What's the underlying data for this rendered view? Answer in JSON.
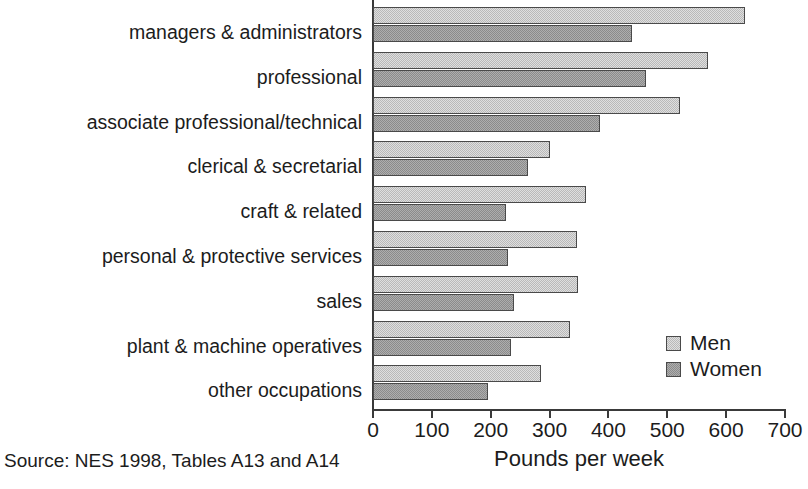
{
  "chart_data": {
    "type": "bar",
    "orientation": "horizontal",
    "title": "",
    "xlabel": "Pounds per week",
    "ylabel": "",
    "xlim": [
      0,
      700
    ],
    "xticks": [
      0,
      100,
      200,
      300,
      400,
      500,
      600,
      700
    ],
    "grid": false,
    "legend_position": "inside-right-lower",
    "categories": [
      "managers & administrators",
      "professional",
      "associate professional/technical",
      "clerical & secretarial",
      "craft & related",
      "personal & protective services",
      "sales",
      "plant & machine operatives",
      "other occupations"
    ],
    "series": [
      {
        "name": "Men",
        "color": "#b9b9b9",
        "values": [
          632,
          569,
          521,
          300,
          362,
          346,
          348,
          334,
          285
        ]
      },
      {
        "name": "Women",
        "color": "#8b8b8b",
        "values": [
          440,
          463,
          385,
          263,
          226,
          229,
          239,
          234,
          195
        ]
      }
    ],
    "source_note": "Source: NES 1998, Tables A13 and A14"
  },
  "legend": {
    "items": [
      {
        "label": "Men",
        "swatch": "men"
      },
      {
        "label": "Women",
        "swatch": "women"
      }
    ]
  },
  "axis": {
    "x_axis_label": "Pounds per week"
  },
  "footer": {
    "source": "Source: NES 1998, Tables A13 and A14"
  }
}
